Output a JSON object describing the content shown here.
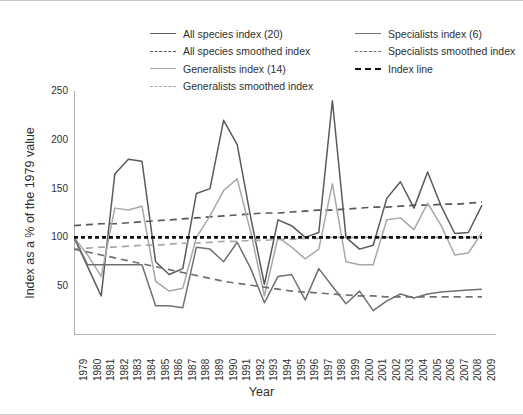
{
  "chart_data": {
    "type": "line",
    "title": "",
    "xlabel": "Year",
    "ylabel": "Index as a % of the 1979 value",
    "xlim": [
      1979,
      2009
    ],
    "ylim": [
      0,
      250
    ],
    "yticks": [
      50,
      100,
      150,
      200,
      250
    ],
    "grid": false,
    "legend_position": "top",
    "x": [
      1979,
      1980,
      1981,
      1982,
      1983,
      1984,
      1985,
      1986,
      1987,
      1988,
      1989,
      1990,
      1991,
      1992,
      1993,
      1994,
      1995,
      1996,
      1997,
      1998,
      1999,
      2000,
      2001,
      2002,
      2003,
      2004,
      2005,
      2006,
      2007,
      2008,
      2009
    ],
    "series": [
      {
        "name": "All species index (20)",
        "style": "solid",
        "color": "#5a5a5a",
        "values": [
          100,
          70,
          40,
          165,
          180,
          178,
          75,
          62,
          68,
          145,
          150,
          220,
          195,
          120,
          52,
          118,
          112,
          100,
          105,
          240,
          100,
          88,
          92,
          140,
          157,
          130,
          167,
          132,
          104,
          105,
          133
        ]
      },
      {
        "name": "All species smoothed index",
        "style": "dashed",
        "color": "#5a5a5a",
        "values": [
          112,
          113,
          114,
          114,
          115,
          116,
          117,
          118,
          119,
          120,
          121,
          122,
          123,
          124,
          125,
          125,
          126,
          127,
          128,
          128,
          129,
          130,
          131,
          131,
          132,
          133,
          133,
          134,
          134,
          135,
          136
        ]
      },
      {
        "name": "Generalists index (14)",
        "style": "solid",
        "color": "#a8a8a8",
        "values": [
          100,
          82,
          60,
          130,
          128,
          132,
          55,
          45,
          48,
          100,
          122,
          148,
          160,
          105,
          40,
          100,
          90,
          78,
          88,
          155,
          75,
          72,
          72,
          118,
          120,
          108,
          135,
          112,
          82,
          84,
          105
        ]
      },
      {
        "name": "Generalists smoothed index",
        "style": "dashed",
        "color": "#a8a8a8",
        "values": [
          88,
          89,
          90,
          90,
          91,
          92,
          92,
          93,
          94,
          94,
          95,
          96,
          96,
          97,
          97,
          98,
          98,
          99,
          99,
          100,
          100,
          100,
          100,
          100,
          100,
          100,
          100,
          100,
          100,
          100,
          100
        ]
      },
      {
        "name": "Specialists index (6)",
        "style": "solid",
        "color": "#707070",
        "values": [
          100,
          72,
          72,
          72,
          72,
          72,
          30,
          30,
          28,
          90,
          88,
          75,
          95,
          68,
          33,
          60,
          62,
          36,
          68,
          50,
          32,
          45,
          25,
          35,
          42,
          38,
          42,
          44,
          45,
          46,
          47
        ]
      },
      {
        "name": "Specialists smoothed index",
        "style": "dashed",
        "color": "#707070",
        "values": [
          88,
          85,
          82,
          79,
          76,
          73,
          70,
          67,
          64,
          61,
          58,
          55,
          53,
          51,
          49,
          47,
          45,
          44,
          43,
          42,
          41,
          40,
          40,
          39,
          39,
          39,
          39,
          39,
          39,
          39,
          39
        ]
      },
      {
        "name": "Index line",
        "style": "dotted-thick",
        "color": "#111111",
        "values": [
          100,
          100,
          100,
          100,
          100,
          100,
          100,
          100,
          100,
          100,
          100,
          100,
          100,
          100,
          100,
          100,
          100,
          100,
          100,
          100,
          100,
          100,
          100,
          100,
          100,
          100,
          100,
          100,
          100,
          100,
          100
        ]
      }
    ]
  },
  "legend": {
    "left_column": [
      {
        "label": "All species index (20)",
        "style": "solid",
        "color": "#5a5a5a"
      },
      {
        "label": "All species smoothed index",
        "style": "dashed",
        "color": "#5a5a5a"
      },
      {
        "label": "Generalists index (14)",
        "style": "solid",
        "color": "#a8a8a8"
      },
      {
        "label": "Generalists smoothed index",
        "style": "dashed",
        "color": "#a8a8a8"
      }
    ],
    "right_column": [
      {
        "label": "Specialists index (6)",
        "style": "solid",
        "color": "#707070"
      },
      {
        "label": "Specialists smoothed index",
        "style": "dashed",
        "color": "#707070"
      },
      {
        "label": "Index line",
        "style": "dotted-thick",
        "color": "#111111"
      }
    ]
  },
  "axes": {
    "y_title": "Index as a % of the 1979 value",
    "x_title": "Year",
    "y_tick_labels": [
      "250",
      "200",
      "150",
      "100",
      "50"
    ],
    "x_tick_labels": [
      "1979",
      "1980",
      "1981",
      "1982",
      "1983",
      "1984",
      "1985",
      "1986",
      "1987",
      "1988",
      "1989",
      "1990",
      "1991",
      "1992",
      "1993",
      "1994",
      "1995",
      "1996",
      "1997",
      "1998",
      "1999",
      "2000",
      "2001",
      "2002",
      "2003",
      "2004",
      "2005",
      "2006",
      "2007",
      "2008",
      "2009"
    ]
  }
}
